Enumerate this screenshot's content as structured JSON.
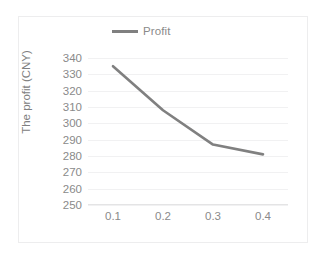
{
  "chart_data": {
    "type": "line",
    "title": "",
    "xlabel": "",
    "ylabel": "The profit (CNY)",
    "x": [
      0.1,
      0.2,
      0.3,
      0.4
    ],
    "x_tick_labels": [
      "0.1",
      "0.2",
      "0.3",
      "0.4"
    ],
    "y_tick_labels": [
      "340",
      "330",
      "320",
      "310",
      "300",
      "290",
      "280",
      "270",
      "260",
      "250"
    ],
    "y_ticks": [
      340,
      330,
      320,
      310,
      300,
      290,
      280,
      270,
      260,
      250
    ],
    "ylim": [
      250,
      340
    ],
    "grid": true,
    "legend_position": "top-center",
    "series": [
      {
        "name": "Profit",
        "values": [
          335,
          308,
          287,
          281
        ],
        "color": "#808080"
      }
    ]
  },
  "legend": {
    "entries": [
      {
        "label": "Profit",
        "color": "#808080"
      }
    ]
  },
  "axes": {
    "y_title": "The profit (CNY)"
  },
  "colors": {
    "series_line": "#808080",
    "gridline": "#f1f1f2",
    "frame_border": "#ededee",
    "tick_text": "#8a8a8a",
    "background": "#ffffff"
  }
}
